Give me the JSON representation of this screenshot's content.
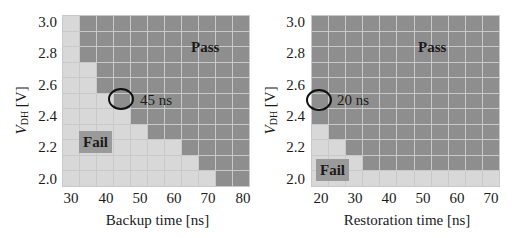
{
  "colors": {
    "pass": "#8e8e8e",
    "fail": "#d8d8d8",
    "gridline": "#c9c9c9"
  },
  "chart_data": [
    {
      "type": "heatmap",
      "title": "",
      "xlabel": "Backup time [ns]",
      "ylabel": "V_DH [V]",
      "ylabel_main": "V",
      "ylabel_sub": "DH",
      "ylabel_unit": " [V]",
      "x": [
        30,
        35,
        40,
        45,
        50,
        55,
        60,
        65,
        70,
        75,
        80
      ],
      "y": [
        3.0,
        2.9,
        2.8,
        2.7,
        2.6,
        2.5,
        2.4,
        2.3,
        2.2,
        2.1,
        2.0
      ],
      "x_tick_labels": [
        "30",
        "40",
        "50",
        "60",
        "70",
        "80"
      ],
      "y_tick_labels": [
        "3.0",
        "2.8",
        "2.6",
        "2.4",
        "2.2",
        "2.0"
      ],
      "legend": {
        "pass": "Pass",
        "fail": "Fail"
      },
      "min_pass_x_per_row": [
        35,
        35,
        35,
        40,
        40,
        45,
        50,
        55,
        65,
        70,
        75
      ],
      "grid": [
        [
          "F",
          "P",
          "P",
          "P",
          "P",
          "P",
          "P",
          "P",
          "P",
          "P",
          "P"
        ],
        [
          "F",
          "P",
          "P",
          "P",
          "P",
          "P",
          "P",
          "P",
          "P",
          "P",
          "P"
        ],
        [
          "F",
          "P",
          "P",
          "P",
          "P",
          "P",
          "P",
          "P",
          "P",
          "P",
          "P"
        ],
        [
          "F",
          "F",
          "P",
          "P",
          "P",
          "P",
          "P",
          "P",
          "P",
          "P",
          "P"
        ],
        [
          "F",
          "F",
          "P",
          "P",
          "P",
          "P",
          "P",
          "P",
          "P",
          "P",
          "P"
        ],
        [
          "F",
          "F",
          "F",
          "P",
          "P",
          "P",
          "P",
          "P",
          "P",
          "P",
          "P"
        ],
        [
          "F",
          "F",
          "F",
          "F",
          "P",
          "P",
          "P",
          "P",
          "P",
          "P",
          "P"
        ],
        [
          "F",
          "F",
          "F",
          "F",
          "F",
          "P",
          "P",
          "P",
          "P",
          "P",
          "P"
        ],
        [
          "F",
          "F",
          "F",
          "F",
          "F",
          "F",
          "F",
          "P",
          "P",
          "P",
          "P"
        ],
        [
          "F",
          "F",
          "F",
          "F",
          "F",
          "F",
          "F",
          "F",
          "P",
          "P",
          "P"
        ],
        [
          "F",
          "F",
          "F",
          "F",
          "F",
          "F",
          "F",
          "F",
          "F",
          "P",
          "P"
        ]
      ],
      "annotation": {
        "text": "45 ns",
        "x": 45,
        "y": 2.5
      },
      "labels": {
        "pass": "Pass",
        "fail": "Fail"
      }
    },
    {
      "type": "heatmap",
      "title": "",
      "xlabel": "Restoration time [ns]",
      "ylabel": "V_DH [V]",
      "ylabel_main": "V",
      "ylabel_sub": "DH",
      "ylabel_unit": " [V]",
      "x": [
        20,
        25,
        30,
        35,
        40,
        45,
        50,
        55,
        60,
        65,
        70
      ],
      "y": [
        3.0,
        2.9,
        2.8,
        2.7,
        2.6,
        2.5,
        2.4,
        2.3,
        2.2,
        2.1,
        2.0
      ],
      "x_tick_labels": [
        "20",
        "30",
        "40",
        "50",
        "60",
        "70"
      ],
      "y_tick_labels": [
        "3.0",
        "2.8",
        "2.6",
        "2.4",
        "2.2",
        "2.0"
      ],
      "legend": {
        "pass": "Pass",
        "fail": "Fail"
      },
      "min_pass_x_per_row": [
        20,
        20,
        20,
        20,
        20,
        20,
        20,
        25,
        30,
        35,
        null
      ],
      "grid": [
        [
          "P",
          "P",
          "P",
          "P",
          "P",
          "P",
          "P",
          "P",
          "P",
          "P",
          "P"
        ],
        [
          "P",
          "P",
          "P",
          "P",
          "P",
          "P",
          "P",
          "P",
          "P",
          "P",
          "P"
        ],
        [
          "P",
          "P",
          "P",
          "P",
          "P",
          "P",
          "P",
          "P",
          "P",
          "P",
          "P"
        ],
        [
          "P",
          "P",
          "P",
          "P",
          "P",
          "P",
          "P",
          "P",
          "P",
          "P",
          "P"
        ],
        [
          "P",
          "P",
          "P",
          "P",
          "P",
          "P",
          "P",
          "P",
          "P",
          "P",
          "P"
        ],
        [
          "P",
          "P",
          "P",
          "P",
          "P",
          "P",
          "P",
          "P",
          "P",
          "P",
          "P"
        ],
        [
          "P",
          "P",
          "P",
          "P",
          "P",
          "P",
          "P",
          "P",
          "P",
          "P",
          "P"
        ],
        [
          "F",
          "P",
          "P",
          "P",
          "P",
          "P",
          "P",
          "P",
          "P",
          "P",
          "P"
        ],
        [
          "F",
          "F",
          "P",
          "P",
          "P",
          "P",
          "P",
          "P",
          "P",
          "P",
          "P"
        ],
        [
          "F",
          "F",
          "F",
          "P",
          "P",
          "P",
          "P",
          "P",
          "P",
          "P",
          "P"
        ],
        [
          "F",
          "F",
          "F",
          "F",
          "F",
          "F",
          "F",
          "F",
          "F",
          "F",
          "F"
        ]
      ],
      "annotation": {
        "text": "20 ns",
        "x": 20,
        "y": 2.5
      },
      "labels": {
        "pass": "Pass",
        "fail": "Fail"
      }
    }
  ]
}
